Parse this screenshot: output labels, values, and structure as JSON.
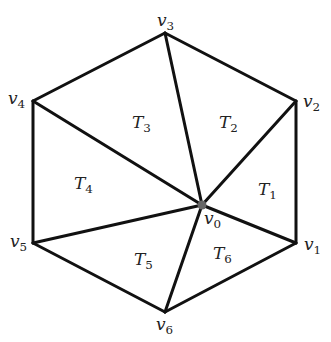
{
  "diagram": {
    "title": "",
    "center": {
      "id": "v0",
      "label": "v",
      "sub": "0",
      "x": 202,
      "y": 205,
      "lx": 204,
      "ly": 224,
      "dot_color": "#666666"
    },
    "vertices": [
      {
        "id": "v1",
        "label": "v",
        "sub": "1",
        "x": 296,
        "y": 243,
        "lx": 304,
        "ly": 250
      },
      {
        "id": "v2",
        "label": "v",
        "sub": "2",
        "x": 296,
        "y": 101,
        "lx": 303,
        "ly": 107
      },
      {
        "id": "v3",
        "label": "v",
        "sub": "3",
        "x": 165,
        "y": 33,
        "lx": 157,
        "ly": 26
      },
      {
        "id": "v4",
        "label": "v",
        "sub": "4",
        "x": 33,
        "y": 101,
        "lx": 8,
        "ly": 104
      },
      {
        "id": "v5",
        "label": "v",
        "sub": "5",
        "x": 33,
        "y": 243,
        "lx": 10,
        "ly": 247
      },
      {
        "id": "v6",
        "label": "v",
        "sub": "6",
        "x": 165,
        "y": 312,
        "lx": 156,
        "ly": 330
      }
    ],
    "triangles": [
      {
        "label": "T",
        "sub": "1",
        "x": 258,
        "y": 195
      },
      {
        "label": "T",
        "sub": "2",
        "x": 219,
        "y": 128
      },
      {
        "label": "T",
        "sub": "3",
        "x": 132,
        "y": 128
      },
      {
        "label": "T",
        "sub": "4",
        "x": 74,
        "y": 189
      },
      {
        "label": "T",
        "sub": "5",
        "x": 134,
        "y": 265
      },
      {
        "label": "T",
        "sub": "6",
        "x": 213,
        "y": 259
      }
    ],
    "stroke_color": "#111111",
    "stroke_width": 3
  }
}
